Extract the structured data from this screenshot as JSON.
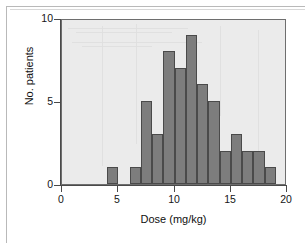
{
  "figure": {
    "background_color": "#ffffff",
    "plot_background_color": "#ebebeb",
    "bar_fill_color": "#7d7d7d",
    "bar_edge_color": "#4a4a4a",
    "axis_color": "#4a4a4a"
  },
  "chart_data": {
    "type": "bar",
    "title": "",
    "xlabel": "Dose (mg/kg)",
    "ylabel": "No. patients",
    "xlim": [
      0,
      20
    ],
    "ylim": [
      0,
      10
    ],
    "xticks": [
      "0",
      "5",
      "10",
      "15",
      "20"
    ],
    "xtick_values": [
      0,
      5,
      10,
      15,
      20
    ],
    "yticks": [
      "0",
      "5",
      "10"
    ],
    "ytick_values": [
      0,
      5,
      10
    ],
    "grid": false,
    "legend": null,
    "bin_width": 1,
    "bin_edges": [
      4,
      5,
      6,
      7,
      8,
      9,
      10,
      11,
      12,
      13,
      14,
      15,
      16,
      17,
      18,
      19
    ],
    "categories": [
      "4-5",
      "5-6",
      "6-7",
      "7-8",
      "8-9",
      "9-10",
      "10-11",
      "11-12",
      "12-13",
      "13-14",
      "14-15",
      "15-16",
      "16-17",
      "17-18",
      "18-19"
    ],
    "bin_starts": [
      4,
      5,
      6,
      7,
      8,
      9,
      10,
      11,
      12,
      13,
      14,
      15,
      16,
      17,
      18
    ],
    "values": [
      1,
      0,
      1,
      5,
      3,
      8,
      7,
      9,
      6,
      5,
      2,
      3,
      2,
      2,
      1
    ],
    "total_patients": 55
  }
}
